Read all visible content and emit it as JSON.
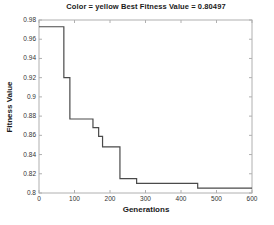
{
  "figure": {
    "background": "#ffffff"
  },
  "chart_data": {
    "type": "line",
    "line_style": "step-after",
    "title": "Color = yellow Best Fitness Value = 0.80497",
    "xlabel": "Generations",
    "ylabel": "Fitness Value",
    "color_name": "yellow",
    "best_fitness_value": "0.80497",
    "xlim": [
      0,
      600
    ],
    "ylim": [
      0.8,
      0.98
    ],
    "xtick_values": [
      0,
      100,
      200,
      300,
      400,
      500,
      600
    ],
    "xtick_labels": [
      "0",
      "100",
      "200",
      "300",
      "400",
      "500",
      "600"
    ],
    "ytick_values": [
      0.8,
      0.82,
      0.84,
      0.86,
      0.88,
      0.9,
      0.92,
      0.94,
      0.96,
      0.98
    ],
    "ytick_labels": [
      "0.8",
      "0.82",
      "0.84",
      "0.86",
      "0.88",
      "0.9",
      "0.92",
      "0.94",
      "0.96",
      "0.98"
    ],
    "grid": false,
    "legend": "none",
    "line_color": "#4a4a4a",
    "axes_color": "#b0b0b0",
    "series": [
      {
        "step_points": [
          {
            "x": 0,
            "y": 0.973
          },
          {
            "x": 70,
            "y": 0.92
          },
          {
            "x": 87,
            "y": 0.877
          },
          {
            "x": 152,
            "y": 0.868
          },
          {
            "x": 168,
            "y": 0.859
          },
          {
            "x": 179,
            "y": 0.848
          },
          {
            "x": 228,
            "y": 0.815
          },
          {
            "x": 275,
            "y": 0.81
          },
          {
            "x": 447,
            "y": 0.805
          },
          {
            "x": 600,
            "y": 0.805
          }
        ]
      }
    ]
  }
}
